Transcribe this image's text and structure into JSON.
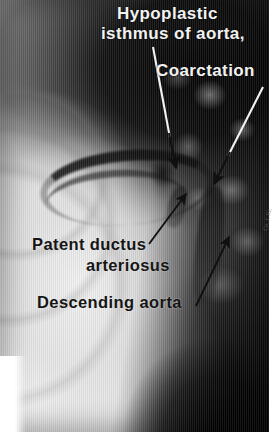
{
  "image": {
    "kind": "annotated-angiogram",
    "modality": "aortogram",
    "background_tone": "#9a9a9a",
    "plate": {
      "width": 269,
      "height": 432
    },
    "margins": {
      "bottom": "#ffffff",
      "right": "#ffffff"
    }
  },
  "annotations": {
    "labels": [
      {
        "id": "hypoplastic-isthmus-line1",
        "text": "Hypoplastic",
        "color": "#f2f2f2",
        "style": "white"
      },
      {
        "id": "hypoplastic-isthmus-line2",
        "text": "isthmus of aorta,",
        "color": "#f2f2f2",
        "style": "white"
      },
      {
        "id": "coarctation",
        "text": "Coarctation",
        "color": "#f2f2f2",
        "style": "white"
      },
      {
        "id": "patent-ductus-line1",
        "text": "Patent ductus",
        "color": "#151515",
        "style": "black"
      },
      {
        "id": "patent-ductus-line2",
        "text": "arteriosus",
        "color": "#151515",
        "style": "black"
      },
      {
        "id": "descending-aorta",
        "text": "Descending aorta",
        "color": "#151515",
        "style": "black"
      }
    ],
    "leader_lines": [
      {
        "id": "arrow-hypoplastic-isthmus",
        "from": [
          153,
          47
        ],
        "to": [
          176,
          168
        ],
        "shaft_color": "#f2f2f2",
        "tip_color": "#101010"
      },
      {
        "id": "arrow-coarctation",
        "from": [
          263,
          87
        ],
        "to": [
          214,
          184
        ],
        "shaft_color": "#f2f2f2",
        "tip_color": "#101010"
      },
      {
        "id": "arrow-patent-ductus",
        "from": [
          149,
          244
        ],
        "to": [
          186,
          194
        ],
        "shaft_color": "#101010",
        "tip_color": "#101010"
      },
      {
        "id": "arrow-descending-aorta",
        "from": [
          196,
          306
        ],
        "to": [
          229,
          237
        ],
        "shaft_color": "#101010",
        "tip_color": "#101010"
      }
    ]
  },
  "margin_note": {
    "text": "Co. J. Ri."
  }
}
